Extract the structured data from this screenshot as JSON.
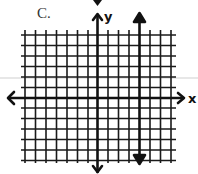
{
  "option_label": "C.",
  "axes": {
    "x_label": "x",
    "y_label": "y"
  },
  "graph": {
    "description": "Coordinate grid with a vertical line",
    "grid_units_x": [
      -7,
      7
    ],
    "grid_units_y": [
      -6,
      6
    ],
    "line": {
      "type": "vertical",
      "x": 4
    }
  },
  "colors": {
    "ink": "#111111",
    "background": "#ffffff",
    "scan_line": "#cfcfcf"
  }
}
